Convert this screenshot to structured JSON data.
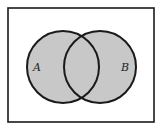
{
  "diagram": {
    "type": "venn",
    "shaded_region": "A union B",
    "sets": [
      {
        "label": "A",
        "cx": 63,
        "cy": 67,
        "r": 36
      },
      {
        "label": "B",
        "cx": 100,
        "cy": 67,
        "r": 36
      }
    ],
    "universe": {
      "x": 8,
      "y": 8,
      "width": 146,
      "height": 114
    },
    "colors": {
      "fill": "#c8c8c8",
      "stroke": "#1a1a1a",
      "background": "#ffffff"
    }
  }
}
